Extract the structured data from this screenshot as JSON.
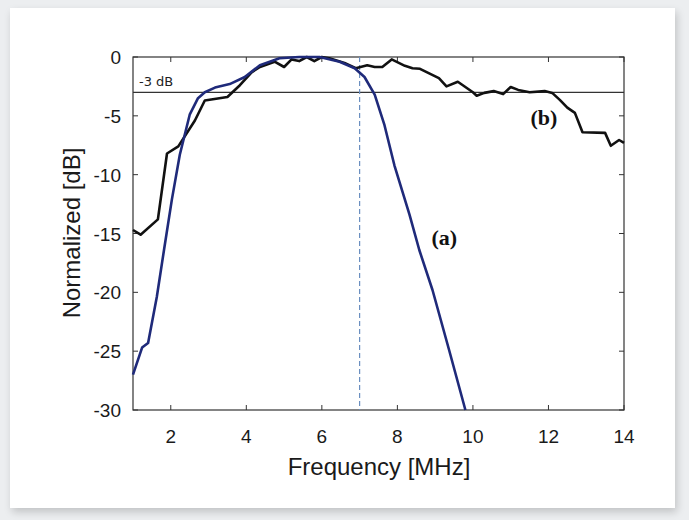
{
  "chart_data": {
    "type": "line",
    "title": "",
    "xlabel": "Frequency [MHz]",
    "ylabel": "Normalized [dB]",
    "xlim": [
      1,
      14
    ],
    "ylim": [
      -30,
      0
    ],
    "xticks": [
      2,
      4,
      6,
      8,
      10,
      12,
      14
    ],
    "yticks": [
      0,
      -5,
      -10,
      -15,
      -20,
      -25,
      -30
    ],
    "grid": false,
    "legend": null,
    "reference_lines": [
      {
        "type": "horizontal",
        "y": -3,
        "label": "-3 dB",
        "color": "#333333",
        "style": "solid"
      },
      {
        "type": "vertical",
        "x": 7,
        "label": "",
        "color": "#6a8fc0",
        "style": "dashed"
      }
    ],
    "annotations": [
      {
        "text": "(a)",
        "x": 8.9,
        "y": -15.3,
        "series": "a"
      },
      {
        "text": "(b)",
        "x": 12.0,
        "y": -5.1,
        "series": "b"
      }
    ],
    "series": [
      {
        "name": "(a)",
        "color": "#1f2a7a",
        "x": [
          1.0,
          1.24,
          1.4,
          1.63,
          1.82,
          2.03,
          2.24,
          2.5,
          2.72,
          2.9,
          3.17,
          3.56,
          3.96,
          4.36,
          4.88,
          5.4,
          5.94,
          6.47,
          6.87,
          7.13,
          7.4,
          7.66,
          7.92,
          8.32,
          8.58,
          8.93,
          9.37,
          9.8
        ],
        "y": [
          -27.0,
          -24.7,
          -24.3,
          -20.4,
          -16.4,
          -12.1,
          -8.3,
          -4.9,
          -3.5,
          -3.0,
          -2.6,
          -2.3,
          -1.7,
          -0.7,
          -0.1,
          0.0,
          0.0,
          -0.4,
          -0.95,
          -1.7,
          -3.2,
          -5.8,
          -9.2,
          -13.4,
          -16.4,
          -19.8,
          -24.9,
          -30.0
        ]
      },
      {
        "name": "(b)",
        "color": "#111111",
        "x": [
          1.0,
          1.2,
          1.66,
          1.9,
          2.2,
          2.64,
          2.9,
          3.5,
          3.83,
          4.14,
          4.36,
          4.75,
          5.0,
          5.2,
          5.4,
          5.6,
          5.8,
          6.0,
          6.2,
          6.6,
          6.9,
          7.2,
          7.4,
          7.6,
          7.85,
          8.2,
          8.4,
          8.6,
          9.1,
          9.3,
          9.6,
          10.0,
          10.1,
          10.3,
          10.55,
          10.8,
          11.0,
          11.2,
          11.5,
          11.9,
          12.1,
          12.3,
          12.5,
          12.7,
          12.9,
          13.5,
          13.65,
          13.87,
          14.0
        ],
        "y": [
          -14.7,
          -15.1,
          -13.8,
          -8.2,
          -7.6,
          -5.4,
          -3.7,
          -3.4,
          -2.4,
          -1.3,
          -0.85,
          -0.4,
          -0.85,
          -0.2,
          -0.35,
          0.0,
          -0.35,
          0.0,
          -0.1,
          -0.5,
          -0.95,
          -0.7,
          -0.85,
          -0.85,
          -0.2,
          -0.75,
          -0.95,
          -1.0,
          -1.8,
          -2.5,
          -2.1,
          -3.0,
          -3.3,
          -3.05,
          -2.9,
          -3.15,
          -2.55,
          -2.8,
          -3.0,
          -2.9,
          -3.05,
          -3.65,
          -4.3,
          -4.75,
          -6.4,
          -6.45,
          -7.55,
          -7.05,
          -7.3
        ]
      }
    ]
  },
  "labels": {
    "xlabel": "Frequency [MHz]",
    "ylabel": "Normalized [dB]",
    "ref_line": "-3 dB",
    "series_a": "(a)",
    "series_b": "(b)"
  }
}
